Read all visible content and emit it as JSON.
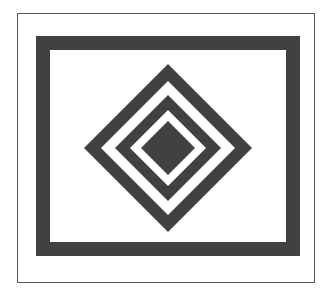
{
  "figure": {
    "colors": {
      "background": "#ffffff",
      "ink": "#414141",
      "border": "#555555"
    },
    "outer_border": {
      "x": 17,
      "y": 13,
      "width": 297,
      "height": 269
    },
    "frame": {
      "x": 36,
      "y": 36,
      "width": 264,
      "height": 220,
      "thickness": 14
    },
    "diamond_center": {
      "x": 168,
      "y": 148
    },
    "diamond_rings_half_diagonals": [
      84,
      67,
      53,
      38,
      27
    ]
  }
}
